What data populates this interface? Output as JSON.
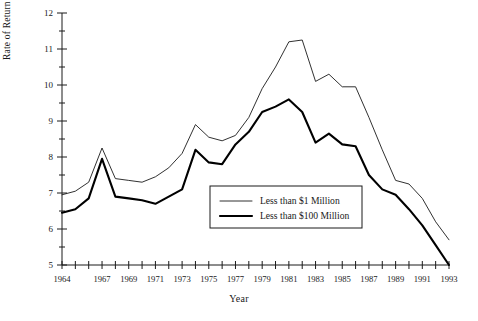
{
  "chart_data": {
    "type": "line",
    "title": "",
    "xlabel": "Year",
    "ylabel": "Rate of Return (Percentage)",
    "xlim": [
      1964,
      1993
    ],
    "ylim": [
      5,
      12
    ],
    "yticks": [
      5,
      6,
      7,
      8,
      9,
      10,
      11,
      12
    ],
    "yticks_minor": [
      5.5,
      6.5,
      7.5,
      8.5,
      9.5,
      10.5,
      11.5
    ],
    "ytick_labels": [
      "5",
      "6",
      "7",
      "8",
      "9",
      "10",
      "11",
      "12"
    ],
    "x": [
      1964,
      1965,
      1966,
      1967,
      1968,
      1969,
      1970,
      1971,
      1972,
      1973,
      1974,
      1975,
      1976,
      1977,
      1978,
      1979,
      1980,
      1981,
      1982,
      1983,
      1984,
      1985,
      1986,
      1987,
      1988,
      1989,
      1990,
      1991,
      1992,
      1993
    ],
    "xtick_labels": [
      "1964",
      "",
      "",
      "1967",
      "",
      "1969",
      "",
      "1971",
      "",
      "1973",
      "",
      "1975",
      "",
      "1977",
      "",
      "1979",
      "",
      "1981",
      "",
      "1983",
      "",
      "1985",
      "",
      "1987",
      "",
      "1989",
      "",
      "1991",
      "",
      "1993"
    ],
    "xticks_labeled": [
      1964,
      1967,
      1969,
      1971,
      1973,
      1975,
      1977,
      1979,
      1981,
      1983,
      1985,
      1987,
      1989,
      1991,
      1993
    ],
    "grid": false,
    "legend_position": "center",
    "series": [
      {
        "name": "Less than $1 Million",
        "style": "thin",
        "values": [
          6.95,
          7.05,
          7.3,
          8.25,
          7.4,
          7.35,
          7.3,
          7.45,
          7.7,
          8.1,
          8.9,
          8.55,
          8.45,
          8.6,
          9.1,
          9.9,
          10.5,
          11.2,
          11.25,
          10.1,
          10.3,
          9.95,
          9.95,
          9.1,
          8.2,
          7.35,
          7.25,
          6.85,
          6.2,
          5.7
        ]
      },
      {
        "name": "Less than $100 Million",
        "style": "thick",
        "values": [
          6.45,
          6.55,
          6.85,
          7.95,
          6.9,
          6.85,
          6.8,
          6.7,
          6.9,
          7.1,
          8.2,
          7.85,
          7.8,
          8.35,
          8.7,
          9.25,
          9.4,
          9.6,
          9.25,
          8.4,
          8.65,
          8.35,
          8.3,
          7.5,
          7.1,
          6.95,
          6.55,
          6.1,
          5.55,
          5.0
        ]
      }
    ]
  },
  "legend": {
    "items": [
      {
        "label": "Less than $1 Million"
      },
      {
        "label": "Less than $100 Million"
      }
    ]
  }
}
